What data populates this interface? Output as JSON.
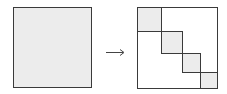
{
  "diagram": {
    "colors": {
      "stroke": "#3a3a3a",
      "fill": "#ececec",
      "background": "#ffffff",
      "arrow": "#444444"
    },
    "left_matrix": {
      "x": 13,
      "y": 7,
      "w": 78,
      "h": 80,
      "filled": true
    },
    "arrow": {
      "x1": 106,
      "y1": 52,
      "x2": 124,
      "y2": 52,
      "glyph": "→"
    },
    "right_matrix": {
      "x": 137,
      "y": 7,
      "w": 80,
      "h": 81,
      "blocks": [
        {
          "x": 137,
          "y": 7,
          "w": 24,
          "h": 24
        },
        {
          "x": 161,
          "y": 31,
          "w": 21,
          "h": 22
        },
        {
          "x": 182,
          "y": 53,
          "w": 18,
          "h": 19
        },
        {
          "x": 200,
          "y": 72,
          "w": 17,
          "h": 16
        }
      ]
    }
  }
}
